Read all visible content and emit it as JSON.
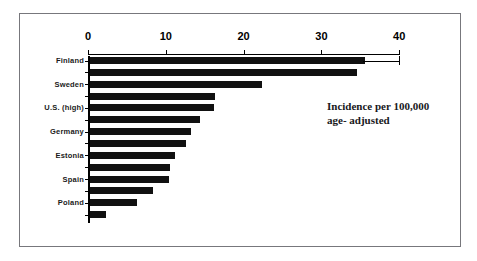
{
  "figure": {
    "background_color": "#ffffff",
    "frame_color": "#77777c",
    "bar_color": "#111111",
    "axis_color": "#000000"
  },
  "annotation": {
    "line1": "Incidence per 100,000",
    "line2": "age- adjusted"
  },
  "chart_data": {
    "type": "bar",
    "orientation": "horizontal",
    "title": "",
    "xlabel": "",
    "ylabel": "",
    "xlim": [
      0,
      40
    ],
    "xticks": [
      0,
      10,
      20,
      30,
      40
    ],
    "xticklabels": [
      "0",
      "10",
      "20",
      "30",
      "40"
    ],
    "grid": false,
    "legend": null,
    "annotations": [
      "Incidence per 100,000",
      "age- adjusted"
    ],
    "note": "Fourteen bars; every other bar carries a country tick label.",
    "categories": [
      "Finland",
      "",
      "Sweden",
      "",
      "U.S. (high)",
      "",
      "Germany",
      "",
      "Estonia",
      "",
      "Spain",
      "",
      "Poland",
      ""
    ],
    "labeled_categories": [
      "Finland",
      "Sweden",
      "U.S. (high)",
      "Germany",
      "Estonia",
      "Spain",
      "Poland"
    ],
    "values": [
      35.4,
      34.3,
      22.1,
      16.1,
      15.9,
      14.2,
      13.0,
      12.3,
      10.9,
      10.3,
      10.1,
      8.1,
      6.1,
      2.1
    ],
    "error_bar": {
      "bar_index": 0,
      "upper": 40.0
    },
    "bars": [
      {
        "index": 0,
        "label": "Finland",
        "value": 35.4,
        "has_whisker": true,
        "whisker_upper": 40.0
      },
      {
        "index": 1,
        "label": "",
        "value": 34.3,
        "has_whisker": false
      },
      {
        "index": 2,
        "label": "Sweden",
        "value": 22.1,
        "has_whisker": false
      },
      {
        "index": 3,
        "label": "",
        "value": 16.1,
        "has_whisker": false
      },
      {
        "index": 4,
        "label": "U.S. (high)",
        "value": 15.9,
        "has_whisker": false
      },
      {
        "index": 5,
        "label": "",
        "value": 14.2,
        "has_whisker": false
      },
      {
        "index": 6,
        "label": "Germany",
        "value": 13.0,
        "has_whisker": false
      },
      {
        "index": 7,
        "label": "",
        "value": 12.3,
        "has_whisker": false
      },
      {
        "index": 8,
        "label": "Estonia",
        "value": 10.9,
        "has_whisker": false
      },
      {
        "index": 9,
        "label": "",
        "value": 10.3,
        "has_whisker": false
      },
      {
        "index": 10,
        "label": "Spain",
        "value": 10.1,
        "has_whisker": false
      },
      {
        "index": 11,
        "label": "",
        "value": 8.1,
        "has_whisker": false
      },
      {
        "index": 12,
        "label": "Poland",
        "value": 6.1,
        "has_whisker": false
      },
      {
        "index": 13,
        "label": "",
        "value": 2.1,
        "has_whisker": false
      }
    ]
  }
}
